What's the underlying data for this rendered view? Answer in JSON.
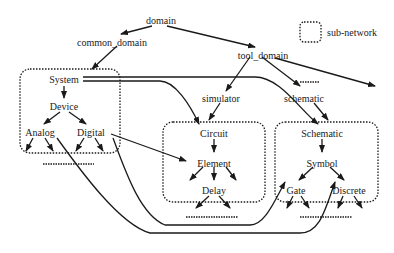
{
  "diagram": {
    "nodes": {
      "domain": "domain",
      "common_domain": "common_domain",
      "tool_domain": "tool_domain",
      "system": "System",
      "device": "Device",
      "analog": "Analog",
      "digital": "Digital",
      "simulator": "simulator",
      "schematic_tool": "schematic",
      "circuit": "Circuit",
      "element": "Element",
      "delay": "Delay",
      "schematic": "Schematic",
      "symbol": "Symbol",
      "gate": "Gate",
      "discrete": "Discrete"
    },
    "legend": {
      "label": "sub-network"
    },
    "subnetworks": [
      "System sub-network",
      "Circuit sub-network",
      "Schematic sub-network"
    ],
    "edges": [
      [
        "domain",
        "common_domain"
      ],
      [
        "domain",
        "tool_domain"
      ],
      [
        "common_domain",
        "System"
      ],
      [
        "tool_domain",
        "simulator"
      ],
      [
        "tool_domain",
        "schematic"
      ],
      [
        "tool_domain",
        "......"
      ],
      [
        "tool_domain",
        "(off-right)"
      ],
      [
        "simulator",
        "Circuit"
      ],
      [
        "schematic",
        "Schematic"
      ],
      [
        "System",
        "Device"
      ],
      [
        "Device",
        "Analog"
      ],
      [
        "Device",
        "Digital"
      ],
      [
        "System",
        "Circuit"
      ],
      [
        "System",
        "Schematic"
      ],
      [
        "Digital",
        "Element"
      ],
      [
        "Digital",
        "Gate"
      ],
      [
        "Analog",
        "Discrete"
      ],
      [
        "Circuit",
        "Element"
      ],
      [
        "Element",
        "Delay"
      ],
      [
        "Schematic",
        "Symbol"
      ],
      [
        "Symbol",
        "Gate"
      ],
      [
        "Symbol",
        "Discrete"
      ]
    ]
  }
}
